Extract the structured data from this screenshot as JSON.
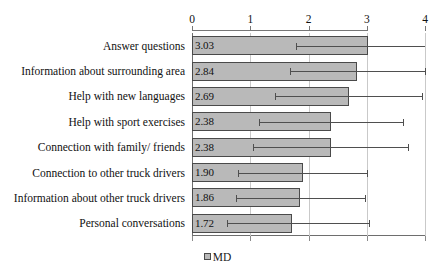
{
  "chart_data": {
    "type": "bar",
    "orientation": "horizontal",
    "title": "",
    "xlabel": "",
    "ylabel": "",
    "xlim": [
      0,
      4
    ],
    "xticks": [
      "0",
      "1",
      "2",
      "3",
      "4"
    ],
    "grid": true,
    "legend": [
      {
        "label": "MD",
        "swatch": "legend-swatch-md",
        "color": "#b9b9b9"
      }
    ],
    "legend_position": "bottom-center",
    "bar_fill_color": "#b9b9b9",
    "bar_border_color": "#4a4a4a",
    "error_bar_color": "#4f4f4f",
    "gridline_color": "#c9c9c9",
    "categories": [
      "Answer questions",
      "Information about surrounding area",
      "Help with new languages",
      "Help with sport exercises",
      "Connection with family/ friends",
      "Connection to other truck drivers",
      "Information about other truck drivers",
      "Personal conversations"
    ],
    "series": [
      {
        "name": "MD",
        "values": [
          3.03,
          2.84,
          2.69,
          2.38,
          2.38,
          1.9,
          1.86,
          1.72
        ],
        "value_labels": [
          "3.03",
          "2.84",
          "2.69",
          "2.38",
          "2.38",
          "1.90",
          "1.86",
          "1.72"
        ],
        "error_low": [
          1.78,
          1.68,
          1.43,
          1.15,
          1.05,
          0.79,
          0.75,
          0.6
        ],
        "error_high": [
          4.05,
          4.0,
          3.95,
          3.62,
          3.71,
          3.01,
          2.97,
          3.04
        ]
      }
    ]
  }
}
